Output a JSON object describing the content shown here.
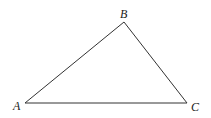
{
  "diagram": {
    "type": "triangle",
    "stroke_color": "#333333",
    "vertices": [
      {
        "label": "A",
        "x": 25,
        "y": 103,
        "label_x": 13,
        "label_y": 110
      },
      {
        "label": "B",
        "x": 124,
        "y": 22,
        "label_x": 120,
        "label_y": 18
      },
      {
        "label": "C",
        "x": 187,
        "y": 103,
        "label_x": 191,
        "label_y": 111
      }
    ]
  }
}
